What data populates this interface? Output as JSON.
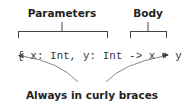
{
  "labels": {
    "parameters": "Parameters",
    "body": "Body",
    "caption": "Always in curly braces"
  },
  "code": {
    "open_brace": "{",
    "parameters": "x: Int, y: Int",
    "arrow": "->",
    "body": "x + y",
    "close_brace": "}",
    "full": "{ x: Int, y: Int -> x + y }"
  },
  "colors": {
    "text": "#222222",
    "code": "#333333",
    "bracket": "#444444",
    "arrow": "#888888"
  }
}
